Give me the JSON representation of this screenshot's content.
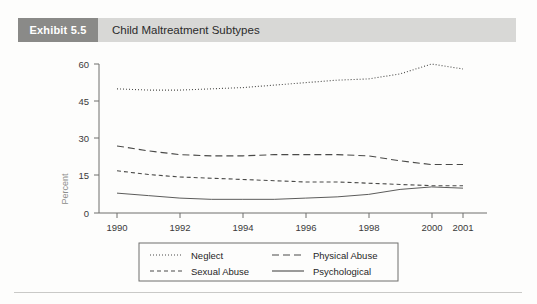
{
  "exhibit": {
    "badge": "Exhibit 5.5",
    "title": "Child Maltreatment Subtypes"
  },
  "colors": {
    "badge_bg": "#8a8a88",
    "header_bg": "#d8d8d6",
    "axis": "#6f6f6d",
    "series": "#4a4a48",
    "axis_title": "#8d8d8b"
  },
  "chart_data": {
    "type": "line",
    "title": "Child Maltreatment Subtypes",
    "xlabel": "",
    "ylabel": "Percent",
    "ylim": [
      0,
      60
    ],
    "yticks": [
      0,
      15,
      30,
      45,
      60
    ],
    "xticks": [
      "1990",
      "1992",
      "1994",
      "1996",
      "1998",
      "2000",
      "2001"
    ],
    "x": [
      1990,
      1991,
      1992,
      1993,
      1994,
      1995,
      1996,
      1997,
      1998,
      1999,
      2000,
      2001
    ],
    "grid": false,
    "legend_position": "bottom",
    "series": [
      {
        "name": "Neglect",
        "style": "dotted",
        "values": [
          50,
          49.5,
          49.5,
          50,
          50.5,
          51.5,
          52.5,
          53.5,
          54,
          56,
          60,
          58
        ]
      },
      {
        "name": "Physical Abuse",
        "style": "dash-long",
        "values": [
          27,
          25,
          23.5,
          23,
          23,
          23.5,
          23.5,
          23.5,
          23,
          21,
          19.5,
          19.5
        ]
      },
      {
        "name": "Sexual Abuse",
        "style": "dashed",
        "values": [
          17,
          15.5,
          14.5,
          14,
          13.5,
          13,
          12.5,
          12.5,
          12,
          11.5,
          11,
          11
        ]
      },
      {
        "name": "Psychological",
        "style": "solid",
        "values": [
          8,
          7,
          6,
          5.5,
          5.5,
          5.5,
          6,
          6.5,
          7.5,
          9.5,
          10.5,
          10
        ]
      }
    ]
  },
  "legend": {
    "items": [
      {
        "label": "Neglect",
        "style": "dotted"
      },
      {
        "label": "Physical Abuse",
        "style": "dash-long"
      },
      {
        "label": "Sexual Abuse",
        "style": "dashed"
      },
      {
        "label": "Psychological",
        "style": "solid"
      }
    ]
  }
}
